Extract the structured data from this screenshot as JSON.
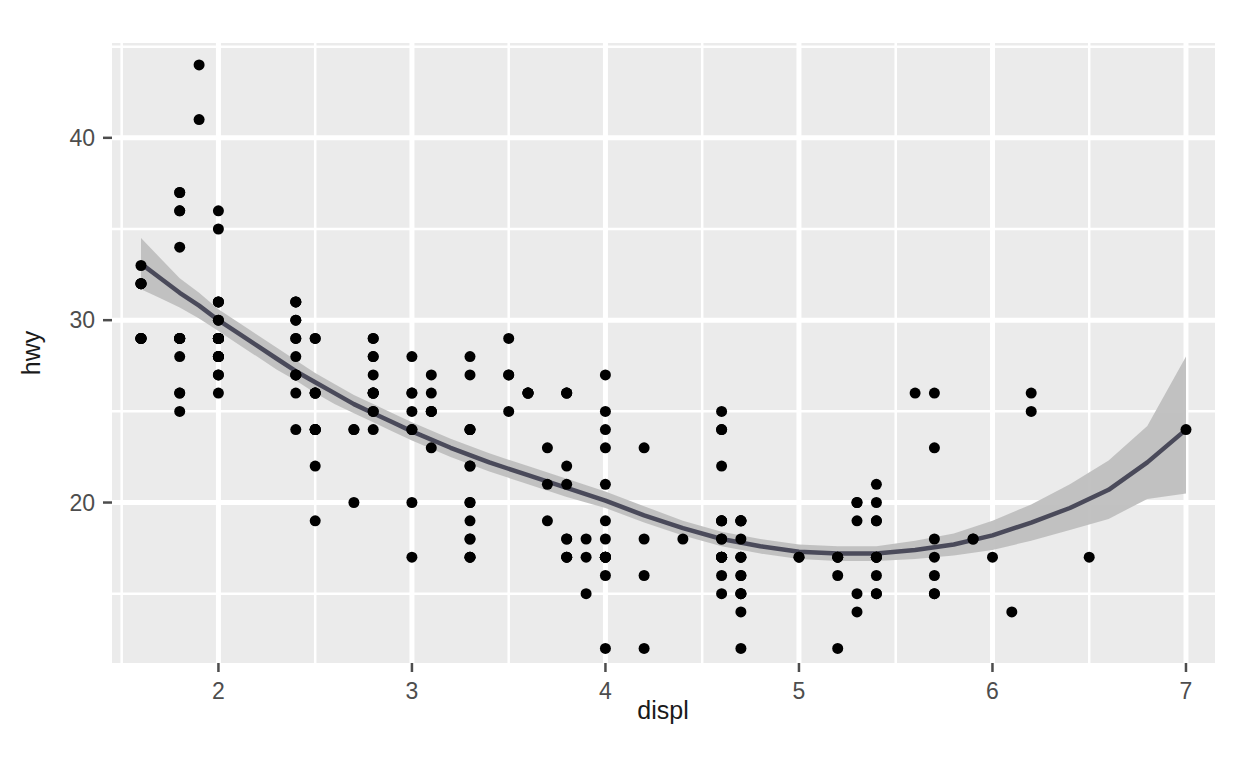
{
  "chart_data": {
    "type": "scatter",
    "title": "",
    "subtitle": "",
    "xlabel": "displ",
    "ylabel": "hwy",
    "xlim": [
      1.45,
      7.15
    ],
    "ylim": [
      11.2,
      45.2
    ],
    "xticks": [
      2,
      3,
      4,
      5,
      6,
      7
    ],
    "yticks": [
      20,
      30,
      40
    ],
    "x_minor_ticks": [
      1.5,
      2.5,
      3.5,
      4.5,
      5.5,
      6.5
    ],
    "y_minor_ticks": [
      15,
      25,
      35,
      45
    ],
    "grid": true,
    "legend": "none",
    "panel_background": "#EBEBEB",
    "gridline_color": "#FFFFFF",
    "point_color": "#000000",
    "point_size": 11,
    "smooth_line_color": "#3366FF",
    "smooth_band_color": "#C0C0C0",
    "smooth_method": "loess",
    "n_points": 234,
    "points": [
      {
        "x": 1.8,
        "y": 29
      },
      {
        "x": 1.8,
        "y": 29
      },
      {
        "x": 2.0,
        "y": 31
      },
      {
        "x": 2.0,
        "y": 30
      },
      {
        "x": 2.8,
        "y": 26
      },
      {
        "x": 2.8,
        "y": 26
      },
      {
        "x": 3.1,
        "y": 27
      },
      {
        "x": 1.8,
        "y": 26
      },
      {
        "x": 1.8,
        "y": 25
      },
      {
        "x": 2.0,
        "y": 28
      },
      {
        "x": 2.0,
        "y": 27
      },
      {
        "x": 2.8,
        "y": 25
      },
      {
        "x": 2.8,
        "y": 25
      },
      {
        "x": 3.1,
        "y": 25
      },
      {
        "x": 3.1,
        "y": 25
      },
      {
        "x": 2.8,
        "y": 24
      },
      {
        "x": 3.1,
        "y": 25
      },
      {
        "x": 4.2,
        "y": 23
      },
      {
        "x": 5.3,
        "y": 20
      },
      {
        "x": 5.3,
        "y": 15
      },
      {
        "x": 5.3,
        "y": 20
      },
      {
        "x": 5.7,
        "y": 17
      },
      {
        "x": 6.0,
        "y": 17
      },
      {
        "x": 5.7,
        "y": 26
      },
      {
        "x": 5.7,
        "y": 23
      },
      {
        "x": 6.2,
        "y": 26
      },
      {
        "x": 6.2,
        "y": 25
      },
      {
        "x": 7.0,
        "y": 24
      },
      {
        "x": 5.3,
        "y": 19
      },
      {
        "x": 5.3,
        "y": 14
      },
      {
        "x": 5.7,
        "y": 15
      },
      {
        "x": 6.5,
        "y": 17
      },
      {
        "x": 2.4,
        "y": 27
      },
      {
        "x": 2.4,
        "y": 30
      },
      {
        "x": 3.1,
        "y": 26
      },
      {
        "x": 3.5,
        "y": 29
      },
      {
        "x": 3.6,
        "y": 26
      },
      {
        "x": 2.4,
        "y": 24
      },
      {
        "x": 3.0,
        "y": 24
      },
      {
        "x": 3.3,
        "y": 22
      },
      {
        "x": 3.3,
        "y": 22
      },
      {
        "x": 3.3,
        "y": 24
      },
      {
        "x": 3.3,
        "y": 24
      },
      {
        "x": 3.3,
        "y": 17
      },
      {
        "x": 3.8,
        "y": 22
      },
      {
        "x": 3.8,
        "y": 21
      },
      {
        "x": 4.0,
        "y": 23
      },
      {
        "x": 3.7,
        "y": 23
      },
      {
        "x": 3.7,
        "y": 19
      },
      {
        "x": 3.9,
        "y": 18
      },
      {
        "x": 3.9,
        "y": 17
      },
      {
        "x": 4.7,
        "y": 17
      },
      {
        "x": 4.7,
        "y": 19
      },
      {
        "x": 4.7,
        "y": 19
      },
      {
        "x": 5.2,
        "y": 12
      },
      {
        "x": 5.2,
        "y": 17
      },
      {
        "x": 3.9,
        "y": 15
      },
      {
        "x": 4.7,
        "y": 17
      },
      {
        "x": 4.7,
        "y": 17
      },
      {
        "x": 4.7,
        "y": 12
      },
      {
        "x": 5.2,
        "y": 17
      },
      {
        "x": 5.7,
        "y": 16
      },
      {
        "x": 5.9,
        "y": 18
      },
      {
        "x": 4.7,
        "y": 15
      },
      {
        "x": 4.7,
        "y": 16
      },
      {
        "x": 4.7,
        "y": 15
      },
      {
        "x": 4.7,
        "y": 15
      },
      {
        "x": 4.7,
        "y": 16
      },
      {
        "x": 4.7,
        "y": 14
      },
      {
        "x": 5.2,
        "y": 17
      },
      {
        "x": 5.2,
        "y": 16
      },
      {
        "x": 5.7,
        "y": 15
      },
      {
        "x": 5.9,
        "y": 18
      },
      {
        "x": 4.6,
        "y": 17
      },
      {
        "x": 5.4,
        "y": 16
      },
      {
        "x": 5.4,
        "y": 15
      },
      {
        "x": 4.0,
        "y": 16
      },
      {
        "x": 4.0,
        "y": 12
      },
      {
        "x": 4.6,
        "y": 17
      },
      {
        "x": 5.0,
        "y": 17
      },
      {
        "x": 4.2,
        "y": 16
      },
      {
        "x": 4.2,
        "y": 12
      },
      {
        "x": 4.6,
        "y": 15
      },
      {
        "x": 4.6,
        "y": 16
      },
      {
        "x": 4.6,
        "y": 17
      },
      {
        "x": 5.4,
        "y": 15
      },
      {
        "x": 5.4,
        "y": 17
      },
      {
        "x": 3.8,
        "y": 17
      },
      {
        "x": 3.8,
        "y": 18
      },
      {
        "x": 4.0,
        "y": 17
      },
      {
        "x": 4.0,
        "y": 19
      },
      {
        "x": 4.6,
        "y": 17
      },
      {
        "x": 4.6,
        "y": 19
      },
      {
        "x": 4.6,
        "y": 19
      },
      {
        "x": 5.4,
        "y": 17
      },
      {
        "x": 1.6,
        "y": 29
      },
      {
        "x": 1.6,
        "y": 32
      },
      {
        "x": 1.6,
        "y": 29
      },
      {
        "x": 1.6,
        "y": 29
      },
      {
        "x": 1.6,
        "y": 29
      },
      {
        "x": 1.8,
        "y": 28
      },
      {
        "x": 1.8,
        "y": 29
      },
      {
        "x": 1.8,
        "y": 26
      },
      {
        "x": 2.0,
        "y": 29
      },
      {
        "x": 2.4,
        "y": 29
      },
      {
        "x": 2.4,
        "y": 29
      },
      {
        "x": 2.4,
        "y": 28
      },
      {
        "x": 2.4,
        "y": 27
      },
      {
        "x": 2.5,
        "y": 24
      },
      {
        "x": 2.5,
        "y": 24
      },
      {
        "x": 3.3,
        "y": 17
      },
      {
        "x": 2.0,
        "y": 28
      },
      {
        "x": 2.0,
        "y": 29
      },
      {
        "x": 2.0,
        "y": 31
      },
      {
        "x": 2.0,
        "y": 30
      },
      {
        "x": 2.7,
        "y": 24
      },
      {
        "x": 2.7,
        "y": 24
      },
      {
        "x": 2.7,
        "y": 20
      },
      {
        "x": 3.0,
        "y": 24
      },
      {
        "x": 3.7,
        "y": 21
      },
      {
        "x": 4.0,
        "y": 21
      },
      {
        "x": 4.7,
        "y": 19
      },
      {
        "x": 4.7,
        "y": 18
      },
      {
        "x": 4.7,
        "y": 19
      },
      {
        "x": 5.7,
        "y": 18
      },
      {
        "x": 6.1,
        "y": 14
      },
      {
        "x": 4.0,
        "y": 17
      },
      {
        "x": 4.2,
        "y": 18
      },
      {
        "x": 4.4,
        "y": 18
      },
      {
        "x": 4.6,
        "y": 18
      },
      {
        "x": 5.4,
        "y": 20
      },
      {
        "x": 5.4,
        "y": 19
      },
      {
        "x": 5.4,
        "y": 19
      },
      {
        "x": 4.0,
        "y": 17
      },
      {
        "x": 4.0,
        "y": 17
      },
      {
        "x": 4.6,
        "y": 19
      },
      {
        "x": 5.0,
        "y": 17
      },
      {
        "x": 2.4,
        "y": 31
      },
      {
        "x": 2.4,
        "y": 31
      },
      {
        "x": 2.5,
        "y": 26
      },
      {
        "x": 2.5,
        "y": 26
      },
      {
        "x": 3.5,
        "y": 27
      },
      {
        "x": 3.5,
        "y": 27
      },
      {
        "x": 3.0,
        "y": 26
      },
      {
        "x": 3.0,
        "y": 25
      },
      {
        "x": 3.5,
        "y": 25
      },
      {
        "x": 3.3,
        "y": 24
      },
      {
        "x": 3.3,
        "y": 27
      },
      {
        "x": 4.0,
        "y": 25
      },
      {
        "x": 5.6,
        "y": 26
      },
      {
        "x": 3.1,
        "y": 23
      },
      {
        "x": 3.8,
        "y": 26
      },
      {
        "x": 3.8,
        "y": 26
      },
      {
        "x": 3.8,
        "y": 26
      },
      {
        "x": 4.0,
        "y": 24
      },
      {
        "x": 4.0,
        "y": 27
      },
      {
        "x": 4.6,
        "y": 25
      },
      {
        "x": 4.6,
        "y": 24
      },
      {
        "x": 4.6,
        "y": 24
      },
      {
        "x": 4.6,
        "y": 22
      },
      {
        "x": 5.4,
        "y": 21
      },
      {
        "x": 1.6,
        "y": 33
      },
      {
        "x": 1.6,
        "y": 32
      },
      {
        "x": 1.6,
        "y": 32
      },
      {
        "x": 1.6,
        "y": 29
      },
      {
        "x": 1.6,
        "y": 32
      },
      {
        "x": 1.8,
        "y": 34
      },
      {
        "x": 1.8,
        "y": 36
      },
      {
        "x": 1.8,
        "y": 36
      },
      {
        "x": 2.0,
        "y": 29
      },
      {
        "x": 2.4,
        "y": 26
      },
      {
        "x": 2.4,
        "y": 27
      },
      {
        "x": 2.4,
        "y": 30
      },
      {
        "x": 2.4,
        "y": 31
      },
      {
        "x": 2.5,
        "y": 26
      },
      {
        "x": 2.5,
        "y": 26
      },
      {
        "x": 3.3,
        "y": 28
      },
      {
        "x": 2.0,
        "y": 26
      },
      {
        "x": 2.0,
        "y": 29
      },
      {
        "x": 2.0,
        "y": 28
      },
      {
        "x": 2.0,
        "y": 27
      },
      {
        "x": 2.5,
        "y": 24
      },
      {
        "x": 2.5,
        "y": 24
      },
      {
        "x": 2.5,
        "y": 24
      },
      {
        "x": 2.5,
        "y": 22
      },
      {
        "x": 2.5,
        "y": 19
      },
      {
        "x": 3.0,
        "y": 20
      },
      {
        "x": 3.0,
        "y": 17
      },
      {
        "x": 3.0,
        "y": 28
      },
      {
        "x": 3.0,
        "y": 26
      },
      {
        "x": 3.3,
        "y": 19
      },
      {
        "x": 3.3,
        "y": 18
      },
      {
        "x": 3.3,
        "y": 20
      },
      {
        "x": 3.3,
        "y": 20
      },
      {
        "x": 3.3,
        "y": 17
      },
      {
        "x": 3.3,
        "y": 18
      },
      {
        "x": 3.8,
        "y": 17
      },
      {
        "x": 3.8,
        "y": 18
      },
      {
        "x": 3.8,
        "y": 17
      },
      {
        "x": 4.0,
        "y": 18
      },
      {
        "x": 4.0,
        "y": 17
      },
      {
        "x": 4.0,
        "y": 17
      },
      {
        "x": 4.6,
        "y": 18
      },
      {
        "x": 4.6,
        "y": 17
      },
      {
        "x": 4.6,
        "y": 17
      },
      {
        "x": 5.4,
        "y": 17
      },
      {
        "x": 5.4,
        "y": 17
      },
      {
        "x": 1.8,
        "y": 37
      },
      {
        "x": 1.8,
        "y": 37
      },
      {
        "x": 2.0,
        "y": 35
      },
      {
        "x": 2.0,
        "y": 36
      },
      {
        "x": 2.8,
        "y": 26
      },
      {
        "x": 2.8,
        "y": 27
      },
      {
        "x": 3.6,
        "y": 26
      },
      {
        "x": 1.9,
        "y": 44
      },
      {
        "x": 2.0,
        "y": 29
      },
      {
        "x": 2.0,
        "y": 31
      },
      {
        "x": 2.0,
        "y": 29
      },
      {
        "x": 2.5,
        "y": 29
      },
      {
        "x": 2.8,
        "y": 28
      },
      {
        "x": 2.8,
        "y": 29
      },
      {
        "x": 3.6,
        "y": 26
      },
      {
        "x": 1.9,
        "y": 41
      },
      {
        "x": 2.0,
        "y": 29
      },
      {
        "x": 2.0,
        "y": 28
      },
      {
        "x": 2.0,
        "y": 29
      },
      {
        "x": 2.5,
        "y": 29
      },
      {
        "x": 2.8,
        "y": 29
      },
      {
        "x": 2.8,
        "y": 28
      },
      {
        "x": 1.8,
        "y": 29
      },
      {
        "x": 1.8,
        "y": 29
      },
      {
        "x": 2.0,
        "y": 28
      },
      {
        "x": 2.0,
        "y": 29
      },
      {
        "x": 2.8,
        "y": 26
      },
      {
        "x": 2.8,
        "y": 26
      },
      {
        "x": 3.6,
        "y": 26
      }
    ],
    "smooth_fit": [
      {
        "x": 1.6,
        "y": 33.1,
        "lo": 31.7,
        "hi": 34.5
      },
      {
        "x": 1.7,
        "y": 32.3,
        "lo": 31.2,
        "hi": 33.4
      },
      {
        "x": 1.8,
        "y": 31.5,
        "lo": 30.7,
        "hi": 32.3
      },
      {
        "x": 1.9,
        "y": 30.8,
        "lo": 30.1,
        "hi": 31.5
      },
      {
        "x": 2.0,
        "y": 30.0,
        "lo": 29.4,
        "hi": 30.6
      },
      {
        "x": 2.1,
        "y": 29.3,
        "lo": 28.7,
        "hi": 29.9
      },
      {
        "x": 2.2,
        "y": 28.6,
        "lo": 28.0,
        "hi": 29.2
      },
      {
        "x": 2.3,
        "y": 27.9,
        "lo": 27.3,
        "hi": 28.5
      },
      {
        "x": 2.4,
        "y": 27.2,
        "lo": 26.7,
        "hi": 27.8
      },
      {
        "x": 2.5,
        "y": 26.6,
        "lo": 26.0,
        "hi": 27.1
      },
      {
        "x": 2.6,
        "y": 26.0,
        "lo": 25.4,
        "hi": 26.5
      },
      {
        "x": 2.7,
        "y": 25.4,
        "lo": 24.9,
        "hi": 25.9
      },
      {
        "x": 2.8,
        "y": 24.9,
        "lo": 24.4,
        "hi": 25.4
      },
      {
        "x": 2.9,
        "y": 24.4,
        "lo": 23.9,
        "hi": 24.9
      },
      {
        "x": 3.0,
        "y": 23.9,
        "lo": 23.4,
        "hi": 24.4
      },
      {
        "x": 3.2,
        "y": 23.0,
        "lo": 22.5,
        "hi": 23.5
      },
      {
        "x": 3.4,
        "y": 22.2,
        "lo": 21.7,
        "hi": 22.7
      },
      {
        "x": 3.6,
        "y": 21.5,
        "lo": 21.0,
        "hi": 22.0
      },
      {
        "x": 3.8,
        "y": 20.8,
        "lo": 20.3,
        "hi": 21.3
      },
      {
        "x": 4.0,
        "y": 20.1,
        "lo": 19.7,
        "hi": 20.6
      },
      {
        "x": 4.2,
        "y": 19.3,
        "lo": 18.9,
        "hi": 19.8
      },
      {
        "x": 4.4,
        "y": 18.6,
        "lo": 18.2,
        "hi": 19.0
      },
      {
        "x": 4.6,
        "y": 18.0,
        "lo": 17.6,
        "hi": 18.4
      },
      {
        "x": 4.8,
        "y": 17.6,
        "lo": 17.2,
        "hi": 18.0
      },
      {
        "x": 5.0,
        "y": 17.3,
        "lo": 16.9,
        "hi": 17.7
      },
      {
        "x": 5.2,
        "y": 17.2,
        "lo": 16.8,
        "hi": 17.6
      },
      {
        "x": 5.4,
        "y": 17.2,
        "lo": 16.8,
        "hi": 17.6
      },
      {
        "x": 5.6,
        "y": 17.4,
        "lo": 16.9,
        "hi": 17.9
      },
      {
        "x": 5.8,
        "y": 17.7,
        "lo": 17.1,
        "hi": 18.3
      },
      {
        "x": 6.0,
        "y": 18.2,
        "lo": 17.4,
        "hi": 19.0
      },
      {
        "x": 6.2,
        "y": 18.9,
        "lo": 17.9,
        "hi": 19.9
      },
      {
        "x": 6.4,
        "y": 19.7,
        "lo": 18.5,
        "hi": 21.0
      },
      {
        "x": 6.6,
        "y": 20.7,
        "lo": 19.1,
        "hi": 22.3
      },
      {
        "x": 6.8,
        "y": 22.2,
        "lo": 20.2,
        "hi": 24.2
      },
      {
        "x": 7.0,
        "y": 24.0,
        "lo": 20.5,
        "hi": 28.0
      }
    ]
  },
  "axes": {
    "x_tick_labels": [
      "2",
      "3",
      "4",
      "5",
      "6",
      "7"
    ],
    "y_tick_labels": [
      "20",
      "30",
      "40"
    ],
    "x_axis_title": "displ",
    "y_axis_title": "hwy"
  }
}
